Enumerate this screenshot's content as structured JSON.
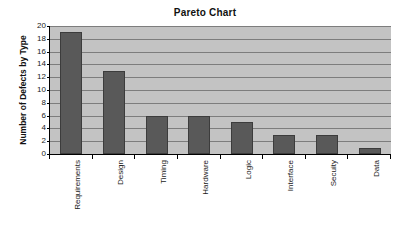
{
  "chart_data": {
    "type": "bar",
    "title": "Pareto Chart",
    "xlabel": "",
    "ylabel": "Number of Defects by Type",
    "categories": [
      "Requirements",
      "Design",
      "Timing",
      "Hardware",
      "Logic",
      "Interface",
      "Secuity",
      "Data"
    ],
    "values": [
      19,
      13,
      6,
      6,
      5,
      3,
      3,
      1
    ],
    "ylim": [
      0,
      20
    ],
    "ytick_labels": [
      "0",
      "2",
      "4",
      "6",
      "8",
      "10",
      "12",
      "14",
      "16",
      "18",
      "20"
    ],
    "ytick_values": [
      0,
      2,
      4,
      6,
      8,
      10,
      12,
      14,
      16,
      18,
      20
    ],
    "grid": true,
    "grid_orientation": "horizontal",
    "legend": false,
    "legend_position": "none",
    "colors": {
      "bar_fill": "#595959",
      "bar_border": "#3c3c3c",
      "plot_background": "#c3c3c3",
      "gridline": "#7d7d7d",
      "axis": "#000000",
      "text": "#1a1a1a",
      "figure_background": "#ffffff"
    }
  }
}
